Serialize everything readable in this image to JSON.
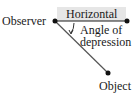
{
  "diagram": {
    "labels": {
      "observer": "Observer",
      "horizontal": "Horizontal",
      "angle_line1": "Angle of",
      "angle_line2": "depression",
      "object": "Object"
    },
    "points": {
      "observer": [
        55,
        21
      ],
      "horizontal_end": [
        127,
        21
      ],
      "object": [
        108,
        73
      ]
    },
    "colors": {
      "line": "#1a1a1a",
      "sight_line": "#555555",
      "shade": "#e6e6e6",
      "text": "#1a1a1a"
    }
  }
}
